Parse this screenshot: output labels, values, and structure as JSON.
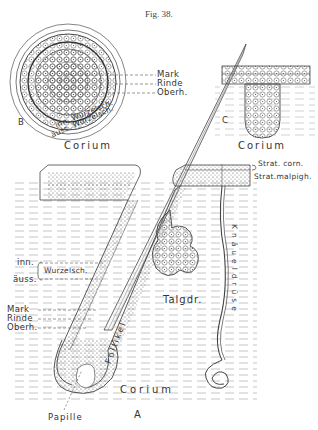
{
  "figure": {
    "title": "Fig. 38.",
    "panels": {
      "B": {
        "panel_label": "B",
        "labels": {
          "mark": "Mark",
          "rinde": "Rinde",
          "oberh": "Oberh.",
          "inner_root_sheath": "inn. Wurzelsch.",
          "outer_root_sheath": "äuss. Wurzelsch.",
          "corium": "Corium"
        }
      },
      "C": {
        "panel_label": "C",
        "labels": {
          "corium": "Corium"
        }
      },
      "A": {
        "panel_label": "A",
        "labels": {
          "strat_corn": "Strat. corn.",
          "strat_malpigh": "Strat.malpigh.",
          "inn": "inn.",
          "auss": "äuss.",
          "wurzelsch": "Wurzelsch.",
          "mark": "Mark",
          "rinde": "Rinde",
          "oberh": "Oberh.",
          "talgdr": "Talgdr.",
          "follikel": "Follikel",
          "knaueldruse": "Knäueldrüse",
          "corium": "Corium",
          "papille": "Papille"
        }
      }
    },
    "colors": {
      "ink": "#3a3a3a",
      "paper": "#ffffff"
    }
  }
}
